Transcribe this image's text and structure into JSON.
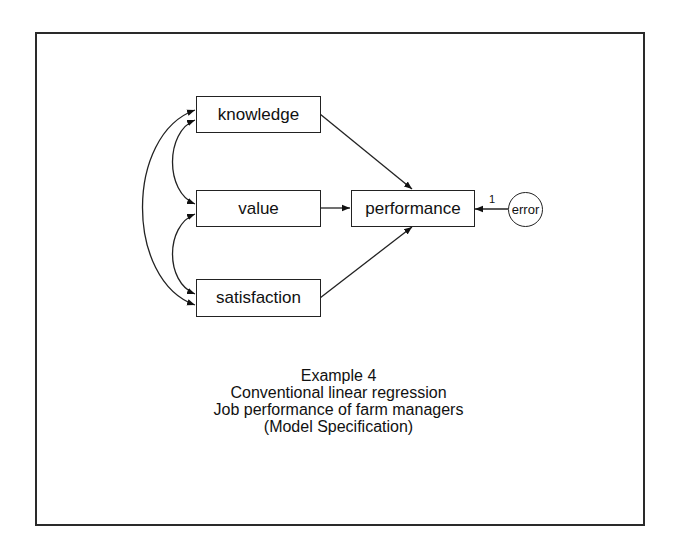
{
  "diagram": {
    "type": "path-diagram",
    "nodes": {
      "knowledge": {
        "label": "knowledge",
        "kind": "observed"
      },
      "value": {
        "label": "value",
        "kind": "observed"
      },
      "satisfaction": {
        "label": "satisfaction",
        "kind": "observed"
      },
      "performance": {
        "label": "performance",
        "kind": "observed"
      },
      "error": {
        "label": "error",
        "kind": "latent"
      }
    },
    "edges": [
      {
        "from": "knowledge",
        "to": "performance",
        "type": "directed"
      },
      {
        "from": "value",
        "to": "performance",
        "type": "directed"
      },
      {
        "from": "satisfaction",
        "to": "performance",
        "type": "directed"
      },
      {
        "from": "error",
        "to": "performance",
        "type": "directed",
        "weight": "1"
      },
      {
        "from": "knowledge",
        "to": "value",
        "type": "covariance"
      },
      {
        "from": "value",
        "to": "satisfaction",
        "type": "covariance"
      },
      {
        "from": "knowledge",
        "to": "satisfaction",
        "type": "covariance"
      }
    ],
    "error_weight": "1"
  },
  "caption": {
    "line1": "Example 4",
    "line2": "Conventional linear regression",
    "line3": "Job performance of farm managers",
    "line4": "(Model Specification)"
  }
}
